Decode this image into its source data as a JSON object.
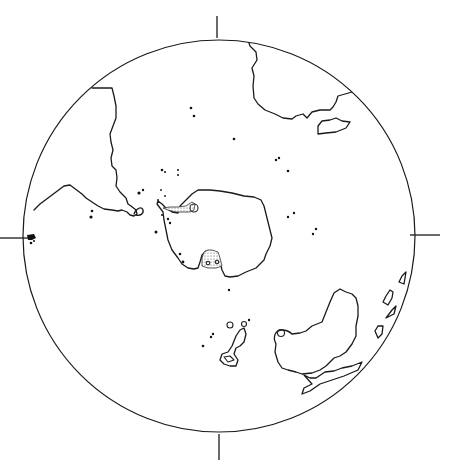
{
  "map": {
    "type": "polar-projection-globe",
    "projection_circle": {
      "cx": 219,
      "cy": 236,
      "r": 196
    },
    "ticks": [
      "top",
      "bottom",
      "left",
      "right"
    ],
    "colors": {
      "line": "#1a1a1a",
      "background": "#ffffff",
      "stipple": "#555555"
    },
    "features": [
      {
        "id": "continent-upper-left",
        "kind": "coastline"
      },
      {
        "id": "continent-upper-right",
        "kind": "coastline"
      },
      {
        "id": "island-upper-right",
        "kind": "island"
      },
      {
        "id": "central-landmass",
        "kind": "coastline",
        "stippled_shelves": 2
      },
      {
        "id": "lower-right-landmass",
        "kind": "coastline"
      },
      {
        "id": "lower-right-peninsula",
        "kind": "coastline"
      },
      {
        "id": "south-island-chain",
        "kind": "island-group"
      },
      {
        "id": "right-edge-islands",
        "kind": "island-group"
      },
      {
        "id": "left-edge-islands",
        "kind": "island-group"
      },
      {
        "id": "scattered-islets",
        "kind": "dots"
      }
    ]
  }
}
